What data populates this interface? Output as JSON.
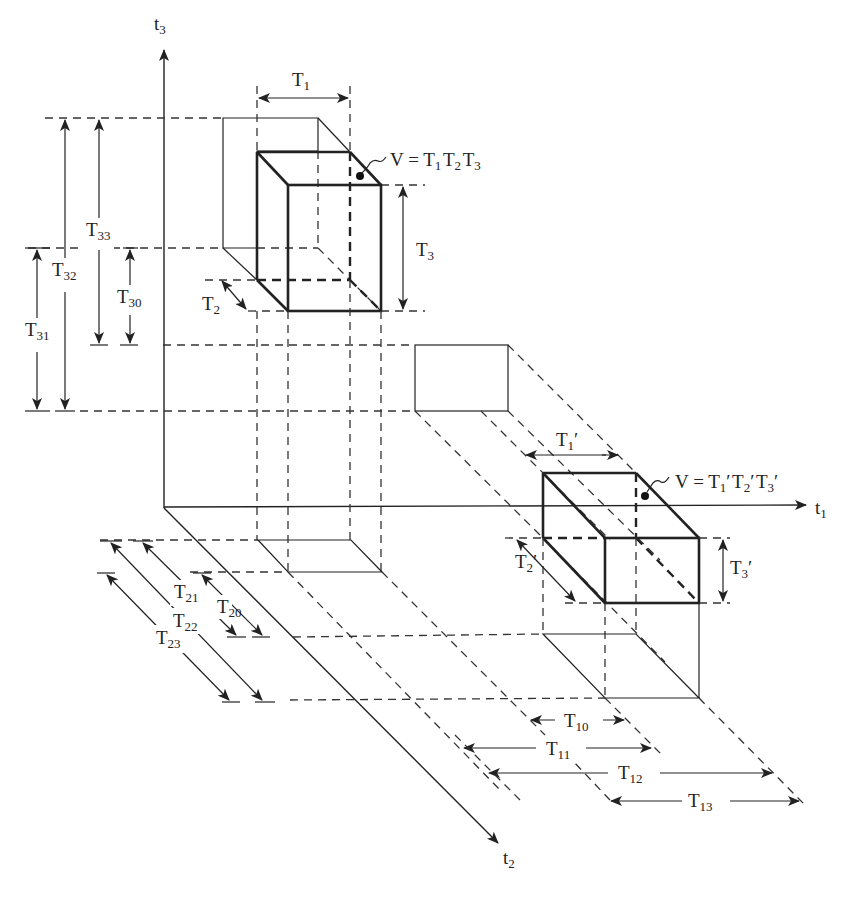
{
  "diagram": {
    "type": "3D orthogonal projection of time-window volumes",
    "axes": {
      "t1": "t1",
      "t2": "t2",
      "t3": "t3"
    },
    "box1": {
      "label": "V = T1 T2 T3",
      "dims": {
        "width": "T1",
        "depth": "T2",
        "height": "T3"
      }
    },
    "box2": {
      "label": "V = T1′ T2′ T3′",
      "dims": {
        "width": "T1′",
        "depth": "T2′",
        "height": "T3′"
      }
    },
    "t3_intervals": [
      "T30",
      "T31",
      "T32",
      "T33"
    ],
    "t2_intervals": [
      "T20",
      "T21",
      "T22",
      "T23"
    ],
    "t1_intervals": [
      "T10",
      "T11",
      "T12",
      "T13"
    ]
  },
  "labels": {
    "t3": {
      "base": "t",
      "sub": "3"
    },
    "t1": {
      "base": "t",
      "sub": "1"
    },
    "t2": {
      "base": "t",
      "sub": "2"
    },
    "T1": {
      "base": "T",
      "sub": "1"
    },
    "T2": {
      "base": "T",
      "sub": "2"
    },
    "T3": {
      "base": "T",
      "sub": "3"
    },
    "V1_prefix": "V = ",
    "T1p": {
      "base": "T",
      "sub": "1",
      "prime": "′"
    },
    "T2p": {
      "base": "T",
      "sub": "2",
      "prime": "′"
    },
    "T3p": {
      "base": "T",
      "sub": "3",
      "prime": "′"
    },
    "V2_prefix": "V = ",
    "T30": {
      "base": "T",
      "sub": "30"
    },
    "T31": {
      "base": "T",
      "sub": "31"
    },
    "T32": {
      "base": "T",
      "sub": "32"
    },
    "T33": {
      "base": "T",
      "sub": "33"
    },
    "T20": {
      "base": "T",
      "sub": "20"
    },
    "T21": {
      "base": "T",
      "sub": "21"
    },
    "T22": {
      "base": "T",
      "sub": "22"
    },
    "T23": {
      "base": "T",
      "sub": "23"
    },
    "T10": {
      "base": "T",
      "sub": "10"
    },
    "T11": {
      "base": "T",
      "sub": "11"
    },
    "T12": {
      "base": "T",
      "sub": "12"
    },
    "T13": {
      "base": "T",
      "sub": "13"
    }
  },
  "colors": {
    "ink": "#222222",
    "background": "#ffffff"
  }
}
